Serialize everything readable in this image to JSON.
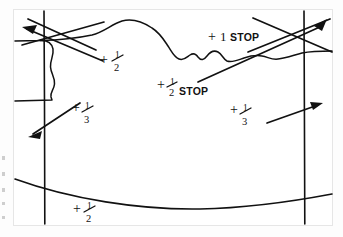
{
  "document": {
    "kind": "hand-annotated photographic print",
    "medium": "ink on photo paper",
    "background_color": "#ffffff",
    "ink_color": "#111111",
    "frame_color": "#e6e6e6"
  },
  "annotations": [
    {
      "id": "sky-upper-right",
      "label": "+1 STOP",
      "plus": "+",
      "amount": "1",
      "unit": "STOP",
      "fraction": false,
      "x": 215,
      "y": 38
    },
    {
      "id": "sky-mid",
      "label": "+1/2 STOP",
      "plus": "+",
      "numerator": "1",
      "denominator": "2",
      "unit": "STOP",
      "fraction": true,
      "x": 163,
      "y": 90
    },
    {
      "id": "upper-left-zone",
      "label": "+1/2",
      "plus": "+",
      "numerator": "1",
      "denominator": "2",
      "unit": "",
      "fraction": true,
      "x": 103,
      "y": 62
    },
    {
      "id": "left-foreground",
      "label": "+1/3",
      "plus": "+",
      "numerator": "1",
      "denominator": "3",
      "unit": "",
      "fraction": true,
      "x": 75,
      "y": 118
    },
    {
      "id": "right-foreground",
      "label": "+1/3",
      "plus": "+",
      "numerator": "1",
      "denominator": "3",
      "unit": "",
      "fraction": true,
      "x": 233,
      "y": 118
    },
    {
      "id": "bottom-edge",
      "label": "+1/2",
      "plus": "+",
      "numerator": "1",
      "denominator": "2",
      "unit": "",
      "fraction": true,
      "x": 76,
      "y": 212
    }
  ],
  "guides": {
    "vertical_lines": [
      {
        "id": "left-vertical",
        "x": 44
      },
      {
        "id": "right-vertical",
        "x": 304
      }
    ],
    "bottom_curve": {
      "id": "bottom-arc",
      "description": "shallow arc across lower print"
    },
    "horizon": {
      "id": "horizon-line",
      "description": "wavy hand-drawn skyline dividing sky from land"
    }
  },
  "pointers": [
    {
      "id": "pointer-top-left",
      "direction": "up-left"
    },
    {
      "id": "pointer-top-right",
      "direction": "up-right"
    },
    {
      "id": "pointer-half-stop",
      "direction": "up-right"
    },
    {
      "id": "pointer-upper-left-half",
      "direction": "up-left"
    },
    {
      "id": "pointer-left-third",
      "direction": "down-left"
    },
    {
      "id": "pointer-right-third",
      "direction": "up-right"
    }
  ]
}
